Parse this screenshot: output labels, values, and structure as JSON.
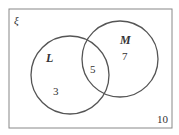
{
  "venn": {
    "universe_symbol": "ξ",
    "sets": [
      {
        "name": "L",
        "only": "3"
      },
      {
        "name": "M",
        "only": "7"
      }
    ],
    "intersection": "5",
    "outside": "10"
  }
}
